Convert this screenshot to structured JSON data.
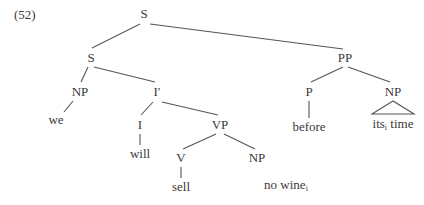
{
  "example_number": "(52)",
  "line_color": "#555555",
  "nodes": [
    {
      "id": "S0",
      "label": "S",
      "x": 144,
      "y": 14
    },
    {
      "id": "S1",
      "label": "S",
      "x": 91,
      "y": 58
    },
    {
      "id": "PP",
      "label": "PP",
      "x": 345,
      "y": 58
    },
    {
      "id": "NP1",
      "label": "NP",
      "x": 80,
      "y": 92
    },
    {
      "id": "Ibar",
      "label": "I′",
      "x": 157,
      "y": 92
    },
    {
      "id": "P",
      "label": "P",
      "x": 309,
      "y": 92
    },
    {
      "id": "NP3",
      "label": "NP",
      "x": 393,
      "y": 92
    },
    {
      "id": "we",
      "label": "we",
      "x": 56,
      "y": 120
    },
    {
      "id": "I",
      "label": "I",
      "x": 140,
      "y": 125
    },
    {
      "id": "VP",
      "label": "VP",
      "x": 220,
      "y": 125
    },
    {
      "id": "before",
      "label": "before",
      "x": 309,
      "y": 127
    },
    {
      "id": "its",
      "label": "its",
      "sub": "i",
      "tail": " time",
      "x": 393,
      "y": 126
    },
    {
      "id": "will",
      "label": "will",
      "x": 140,
      "y": 154
    },
    {
      "id": "V",
      "label": "V",
      "x": 181,
      "y": 158
    },
    {
      "id": "NP2",
      "label": "NP",
      "x": 257,
      "y": 158
    },
    {
      "id": "sell",
      "label": "sell",
      "x": 181,
      "y": 187
    },
    {
      "id": "nowine",
      "label": "no wine",
      "sub": "i",
      "x": 286,
      "y": 187
    }
  ],
  "edges": [
    {
      "from": [
        140,
        24
      ],
      "to": [
        92,
        48
      ]
    },
    {
      "from": [
        150,
        24
      ],
      "to": [
        343,
        49
      ]
    },
    {
      "from": [
        88,
        67
      ],
      "to": [
        81,
        82
      ]
    },
    {
      "from": [
        94,
        67
      ],
      "to": [
        155,
        82
      ]
    },
    {
      "from": [
        343,
        67
      ],
      "to": [
        311,
        82
      ]
    },
    {
      "from": [
        348,
        67
      ],
      "to": [
        390,
        82
      ]
    },
    {
      "from": [
        73,
        101
      ],
      "to": [
        64,
        112
      ]
    },
    {
      "from": [
        153,
        102
      ],
      "to": [
        141,
        115
      ]
    },
    {
      "from": [
        162,
        102
      ],
      "to": [
        218,
        115
      ]
    },
    {
      "from": [
        309,
        101
      ],
      "to": [
        309,
        118
      ]
    },
    {
      "from": [
        140,
        134
      ],
      "to": [
        140,
        145
      ]
    },
    {
      "from": [
        216,
        134
      ],
      "to": [
        183,
        149
      ]
    },
    {
      "from": [
        224,
        134
      ],
      "to": [
        255,
        149
      ]
    },
    {
      "from": [
        181,
        167
      ],
      "to": [
        181,
        178
      ]
    }
  ],
  "triangles": [
    {
      "apex": [
        393,
        101
      ],
      "left": [
        372,
        114
      ],
      "right": [
        414,
        114
      ]
    }
  ]
}
